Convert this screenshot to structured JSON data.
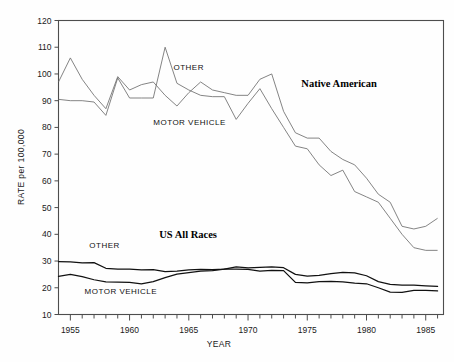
{
  "chart_data": {
    "type": "line",
    "title": "",
    "xlabel": "YEAR",
    "ylabel": "RATE per 100,000",
    "xlim": [
      1954,
      1986.5
    ],
    "ylim": [
      10,
      120
    ],
    "xticks_major": [
      1955,
      1960,
      1965,
      1970,
      1975,
      1980,
      1985
    ],
    "xtick_labels": [
      "1955",
      "1960",
      "1965",
      "1970",
      "1975",
      "1980",
      "1985"
    ],
    "xtick_interval_minor": 1,
    "yticks": [
      10,
      20,
      30,
      40,
      50,
      60,
      70,
      80,
      90,
      100,
      110,
      120
    ],
    "ytick_labels": [
      "10",
      "20",
      "30",
      "40",
      "50",
      "60",
      "70",
      "80",
      "90",
      "100",
      "110",
      "120"
    ],
    "grid": false,
    "legend_position": "inline-annotations",
    "annotations": [
      {
        "text": "OTHER",
        "x": 1963.7,
        "y": 101.5,
        "style": "sans-caps",
        "group": "native-american"
      },
      {
        "text": "MOTOR VEHICLE",
        "x": 1962.0,
        "y": 81.0,
        "style": "sans-caps",
        "group": "native-american"
      },
      {
        "text": "Native American",
        "x": 1974.5,
        "y": 95.0,
        "style": "serif-bold",
        "group": "native-american"
      },
      {
        "text": "OTHER",
        "x": 1956.6,
        "y": 35.0,
        "style": "sans-caps",
        "group": "us-all-races"
      },
      {
        "text": "MOTOR VEHICLE",
        "x": 1956.2,
        "y": 17.5,
        "style": "sans-caps",
        "group": "us-all-races"
      },
      {
        "text": "US All Races",
        "x": 1962.5,
        "y": 38.5,
        "style": "serif-bold",
        "group": "us-all-races"
      }
    ],
    "x": [
      1954,
      1955,
      1956,
      1957,
      1958,
      1959,
      1960,
      1961,
      1962,
      1963,
      1964,
      1965,
      1966,
      1967,
      1968,
      1969,
      1970,
      1971,
      1972,
      1973,
      1974,
      1975,
      1976,
      1977,
      1978,
      1979,
      1980,
      1981,
      1982,
      1983,
      1984,
      1985,
      1986
    ],
    "series": [
      {
        "name": "Native American - OTHER",
        "group": "Native American",
        "style": "thin",
        "values": [
          97,
          106,
          98,
          92,
          87,
          99,
          94,
          96,
          97,
          92,
          88,
          93,
          97,
          94,
          93,
          92,
          92,
          98,
          100,
          86,
          78,
          76,
          76,
          71,
          68,
          66,
          61,
          55,
          52,
          43,
          42,
          43,
          46
        ]
      },
      {
        "name": "Native American - MOTOR VEHICLE",
        "group": "Native American",
        "style": "thin",
        "values": [
          90.5,
          90,
          90,
          89.5,
          84.5,
          98.5,
          91,
          91,
          91,
          110,
          96.5,
          94,
          92,
          91.5,
          91.5,
          83,
          89,
          94.5,
          87,
          80,
          73,
          72,
          66,
          62,
          64,
          56,
          54,
          52,
          46,
          40,
          35,
          34,
          34
        ]
      },
      {
        "name": "US All Races - OTHER",
        "group": "US All Races",
        "style": "thick",
        "values": [
          29.8,
          29.7,
          29.3,
          29.4,
          27.3,
          27.0,
          27.0,
          26.7,
          26.8,
          26.0,
          26.2,
          26.7,
          26.9,
          26.8,
          27.0,
          27.8,
          27.4,
          27.6,
          27.8,
          27.5,
          25.0,
          24.4,
          24.6,
          25.3,
          25.8,
          25.6,
          24.5,
          22.3,
          21.3,
          21.0,
          21.0,
          20.7,
          20.5
        ]
      },
      {
        "name": "US All Races - MOTOR VEHICLE",
        "group": "US All Races",
        "style": "thick",
        "values": [
          24.3,
          25.0,
          24.2,
          23.0,
          22.2,
          22.1,
          22.0,
          21.5,
          22.3,
          23.8,
          25.1,
          25.7,
          26.2,
          26.4,
          27.0,
          27.0,
          26.9,
          26.2,
          26.5,
          26.4,
          22.0,
          21.8,
          22.3,
          22.4,
          22.2,
          21.7,
          21.5,
          20.0,
          18.4,
          18.3,
          19.0,
          19.0,
          18.8
        ]
      }
    ]
  },
  "colors": {
    "frame": "#4d4d4d",
    "thin_line": "#6e6e6e",
    "thick_line": "#111111",
    "text": "#1a1a1a",
    "background": "#fefefe"
  }
}
